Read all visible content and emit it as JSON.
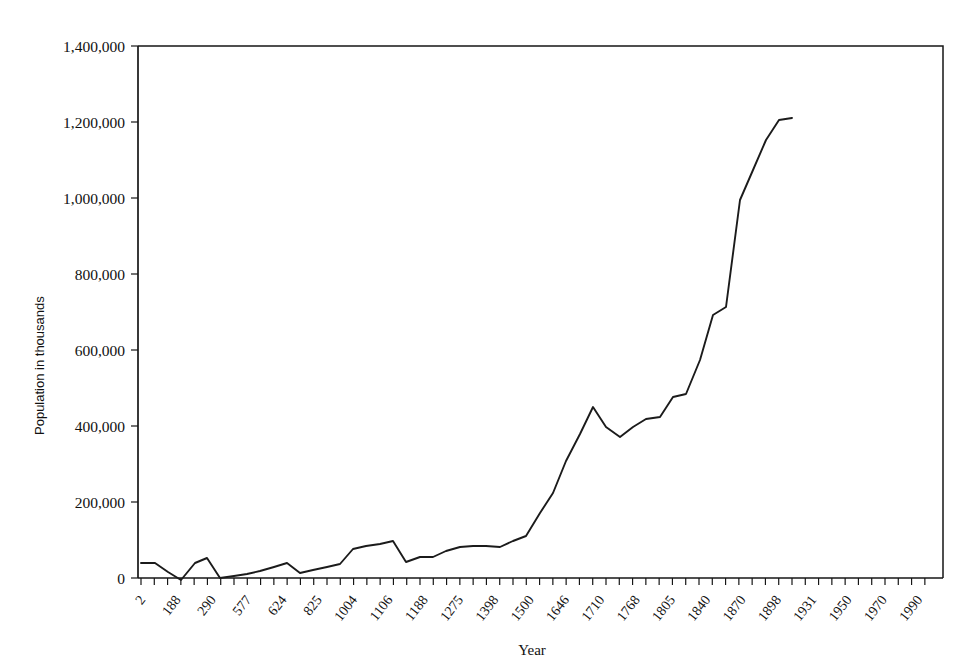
{
  "chart_data": {
    "type": "line",
    "title": "",
    "subtitle": "",
    "xlabel": "Year",
    "ylabel": "Population in thousands",
    "grid": false,
    "legend": "none",
    "ylim": [
      0,
      1400000
    ],
    "ytick_labels": [
      "1,400,000",
      "1,200,000",
      "1,000,000",
      "800,000",
      "600,000",
      "400,000",
      "200,000",
      "0"
    ],
    "ytick_values": [
      1400000,
      1200000,
      1000000,
      800000,
      600000,
      400000,
      200000,
      0
    ],
    "xtick_labels": [
      "2",
      "188",
      "290",
      "577",
      "624",
      "825",
      "1004",
      "1106",
      "1188",
      "1275",
      "1398",
      "1500",
      "1646",
      "1710",
      "1768",
      "1805",
      "1840",
      "1870",
      "1898",
      "1931",
      "1950",
      "1970",
      "1990"
    ],
    "series": [
      {
        "name": "World population",
        "x": [
          2,
          100,
          188,
          240,
          290,
          420,
          577,
          600,
          624,
          700,
          825,
          900,
          1004,
          1050,
          1106,
          1150,
          1188,
          1225,
          1275,
          1340,
          1398,
          1450,
          1500,
          1575,
          1646,
          1680,
          1710,
          1740,
          1768,
          1787,
          1805,
          1823,
          1840,
          1855,
          1870,
          1885,
          1898,
          1915,
          1931,
          1940,
          1950,
          1960,
          1970,
          1980,
          1990,
          1998
        ],
        "values": [
          55000,
          55000,
          35000,
          15000,
          50000,
          60000,
          18000,
          22000,
          28000,
          33000,
          42000,
          55000,
          28000,
          33000,
          42000,
          48000,
          90000,
          100000,
          105000,
          115000,
          60000,
          75000,
          72000,
          90000,
          105000,
          110000,
          110000,
          105000,
          128000,
          140000,
          200000,
          250000,
          310000,
          380000,
          450000,
          400000,
          370000,
          395000,
          420000,
          425000,
          480000,
          490000,
          580000,
          700000,
          720000,
          1235000
        ]
      }
    ],
    "curve_points_px": [
      [
        141,
        563
      ],
      [
        155,
        563
      ],
      [
        168,
        572
      ],
      [
        181,
        580
      ],
      [
        195,
        563
      ],
      [
        207,
        558
      ],
      [
        220,
        578
      ],
      [
        234,
        576
      ],
      [
        247,
        574
      ],
      [
        260,
        571
      ],
      [
        274,
        567
      ],
      [
        287,
        563
      ],
      [
        300,
        573
      ],
      [
        313,
        570
      ],
      [
        327,
        567
      ],
      [
        340,
        564
      ],
      [
        353,
        549
      ],
      [
        366,
        546
      ],
      [
        380,
        544
      ],
      [
        393,
        541
      ],
      [
        406,
        562
      ],
      [
        420,
        557
      ],
      [
        433,
        557
      ],
      [
        446,
        551
      ],
      [
        460,
        547
      ],
      [
        473,
        546
      ],
      [
        486,
        546
      ],
      [
        500,
        547
      ],
      [
        513,
        541
      ],
      [
        526,
        536
      ],
      [
        540,
        513
      ],
      [
        553,
        493
      ],
      [
        566,
        461
      ],
      [
        580,
        434
      ],
      [
        593,
        407
      ],
      [
        606,
        427
      ],
      [
        620,
        437
      ],
      [
        633,
        427
      ],
      [
        646,
        419
      ],
      [
        660,
        417
      ],
      [
        673,
        397
      ],
      [
        686,
        394
      ],
      [
        700,
        360
      ],
      [
        713,
        315
      ],
      [
        726,
        307
      ],
      [
        740,
        200
      ],
      [
        753,
        170
      ],
      [
        766,
        140
      ],
      [
        779,
        120
      ],
      [
        792,
        118
      ]
    ]
  },
  "plot_geometry": {
    "left": 138,
    "right": 943,
    "top": 46,
    "bottom": 578
  }
}
